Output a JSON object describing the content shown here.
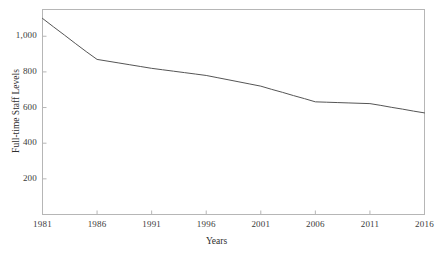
{
  "chart_data": {
    "type": "line",
    "title": "",
    "xlabel": "Years",
    "ylabel": "Full-time Staff Levels",
    "xlim": [
      1981,
      2016
    ],
    "ylim": [
      0,
      1150
    ],
    "grid": false,
    "legend": false,
    "legend_position": "none",
    "xticks": [
      1981,
      1986,
      1991,
      1996,
      2001,
      2006,
      2011,
      2016
    ],
    "xtick_labels": [
      "1981",
      "1986",
      "1991",
      "1996",
      "2001",
      "2006",
      "2011",
      "2016"
    ],
    "yticks": [
      200,
      400,
      600,
      800,
      1000
    ],
    "ytick_labels": [
      "200",
      "400",
      "600",
      "800",
      "1,000"
    ],
    "series": [
      {
        "name": "Full-time Staff Levels",
        "color": "#555555",
        "x": [
          1981,
          1982,
          1983,
          1984,
          1985,
          1986,
          1987,
          1988,
          1989,
          1990,
          1991,
          1992,
          1993,
          1994,
          1995,
          1996,
          1997,
          1998,
          1999,
          2000,
          2001,
          2002,
          2003,
          2004,
          2005,
          2006,
          2007,
          2008,
          2009,
          2010,
          2011,
          2012,
          2013,
          2014,
          2015,
          2016
        ],
        "values": [
          1100,
          1053,
          1007,
          960,
          914,
          870,
          860,
          850,
          840,
          830,
          820,
          812,
          804,
          796,
          788,
          780,
          768,
          756,
          744,
          732,
          720,
          702,
          685,
          667,
          650,
          632,
          630,
          628,
          626,
          624,
          622,
          612,
          601,
          591,
          580,
          570
        ]
      }
    ],
    "markers": {
      "1981": 1100,
      "1986": 870,
      "1991": 820,
      "1996": 780,
      "2001": 720,
      "2006": 632,
      "2011": 622,
      "2016": 570
    }
  },
  "axis": {
    "frame_color": "#b6b6b6",
    "line_color": "#555555",
    "text_color": "#3a3a3a"
  }
}
